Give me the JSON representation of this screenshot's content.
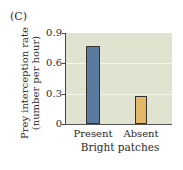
{
  "panel_label": "(C)",
  "chart_data": {
    "type": "bar",
    "title": "",
    "categories": [
      "Present",
      "Absent"
    ],
    "values": [
      0.77,
      0.28
    ],
    "colors": [
      "#5a7aa0",
      "#e2b768"
    ],
    "xlabel": "Bright patches",
    "ylabel": "Prey interception rate (number per hour)",
    "ylabel_lines": [
      "Prey interception rate",
      "(number per hour)"
    ],
    "ylim": [
      0,
      0.9
    ],
    "yticks": [
      0,
      0.3,
      0.6,
      0.9
    ],
    "ytick_labels": [
      "0",
      "0.3",
      "0.6",
      "0.9"
    ],
    "grid": true,
    "legend": null
  },
  "colors": {
    "plot_background": "#dfe3cf",
    "gridline": "#f6f7ee"
  }
}
